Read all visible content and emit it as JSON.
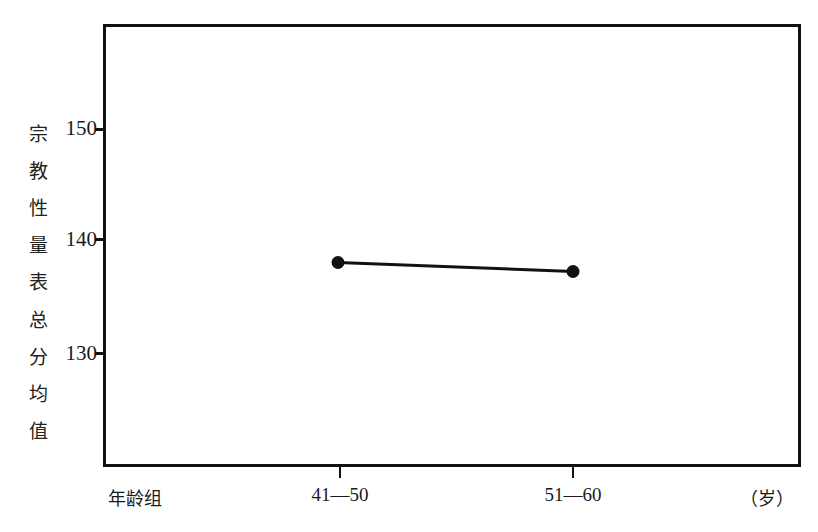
{
  "chart_data": {
    "type": "line",
    "title": "",
    "xlabel": "年龄组",
    "xunit": "（岁）",
    "ylabel": "宗教性量表总分均值",
    "categories": [
      "41—50",
      "51—60"
    ],
    "series": [
      {
        "name": "宗教性量表总分均值",
        "values": [
          137.9,
          137.1
        ]
      }
    ],
    "yticks": [
      "150",
      "140",
      "130"
    ],
    "ylim": [
      120,
      160
    ],
    "grid": false,
    "legend": null,
    "marker": "filled-circle",
    "line_color": "#111111"
  },
  "ylabel_chars": [
    "宗",
    "教",
    "性",
    "量",
    "表",
    "总",
    "分",
    "均",
    "值"
  ]
}
